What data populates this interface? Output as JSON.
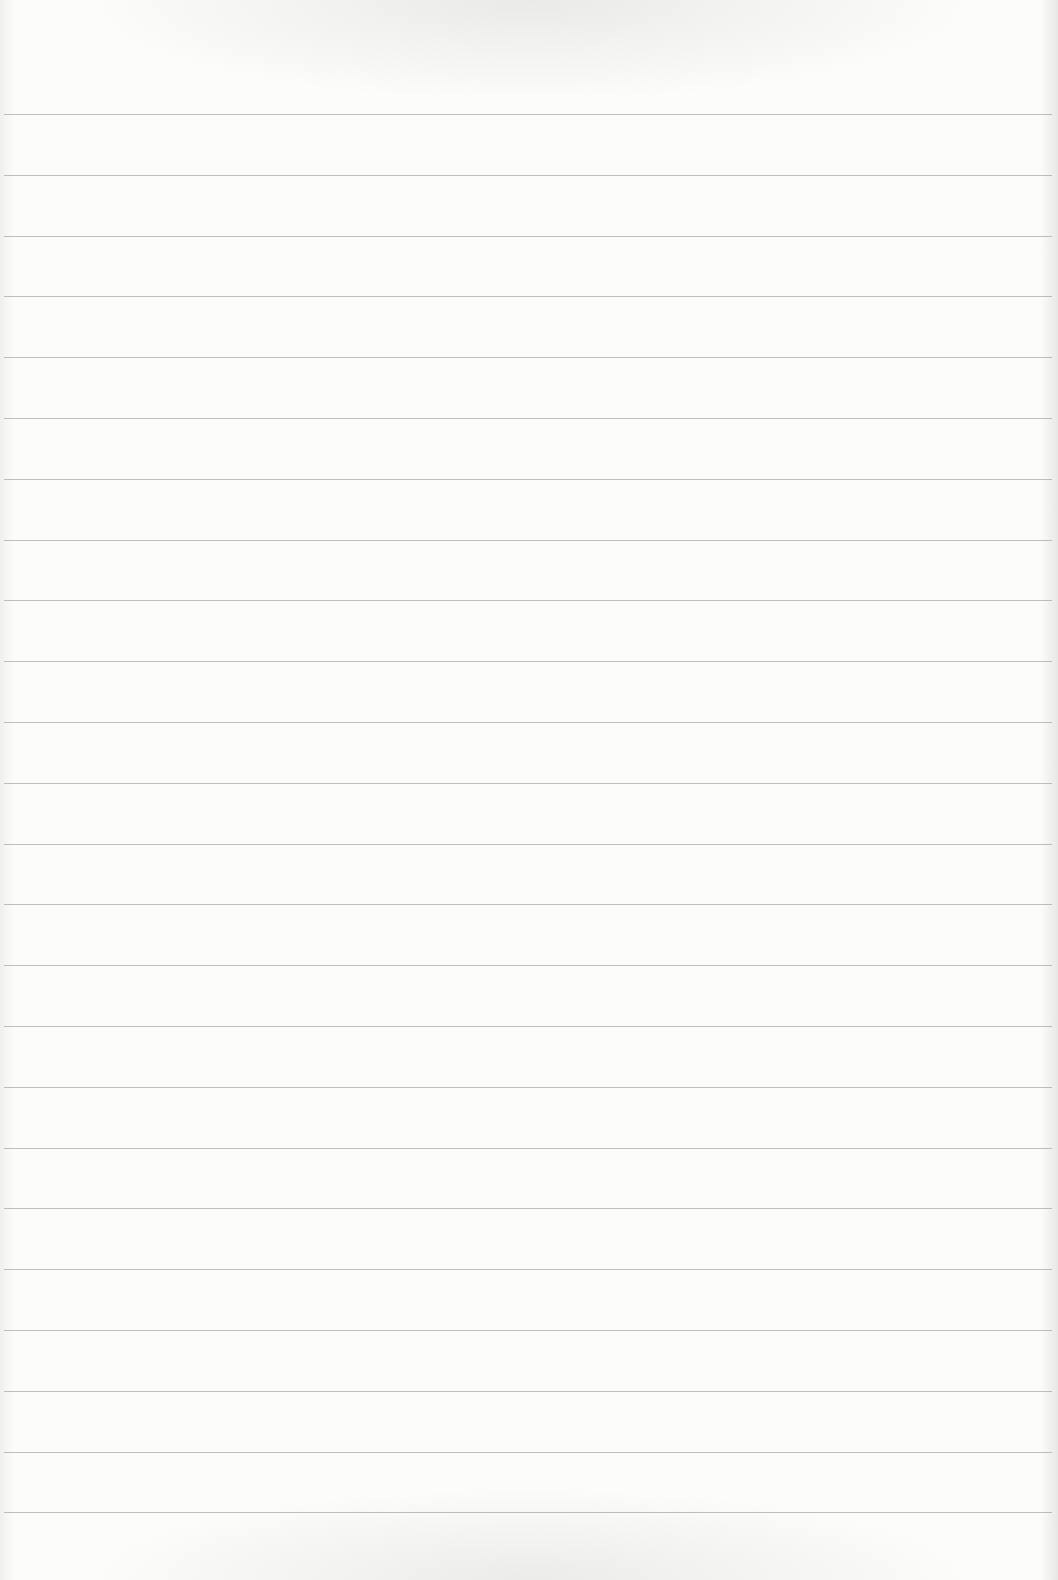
{
  "document": {
    "type": "lined-paper",
    "content_text": "",
    "paper_color": "#fcfcfb",
    "rule_color": "#a9a9a7",
    "rules": {
      "count": 24,
      "first_y": 114,
      "spacing": 60.8
    }
  }
}
